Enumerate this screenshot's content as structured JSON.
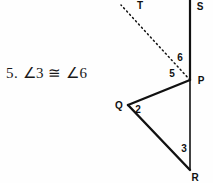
{
  "problem": {
    "number": "5.",
    "statement": "∠3 ≅ ∠6",
    "full_text": "5.  ∠3 ≅ ∠6"
  },
  "diagram": {
    "points": [
      {
        "label": "S",
        "x": 200,
        "y": 10
      },
      {
        "label": "T",
        "x": 140,
        "y": 9
      },
      {
        "label": "P",
        "x": 201,
        "y": 84
      },
      {
        "label": "Q",
        "x": 119,
        "y": 109
      },
      {
        "label": "R",
        "x": 195,
        "y": 181
      }
    ],
    "angle_labels": [
      {
        "label": "6",
        "x": 180,
        "y": 61
      },
      {
        "label": "5",
        "x": 172,
        "y": 77
      },
      {
        "label": "2",
        "x": 138,
        "y": 113
      },
      {
        "label": "3",
        "x": 184,
        "y": 152
      }
    ],
    "solid_segments": [
      {
        "name": "segment-SP",
        "x1": 190,
        "y1": 0,
        "x2": 190,
        "y2": 80
      },
      {
        "name": "segment-PR",
        "x1": 190,
        "y1": 80,
        "x2": 190,
        "y2": 170
      },
      {
        "name": "segment-PQ",
        "x1": 190,
        "y1": 80,
        "x2": 128,
        "y2": 105
      },
      {
        "name": "segment-QR",
        "x1": 128,
        "y1": 105,
        "x2": 190,
        "y2": 170
      }
    ],
    "dotted_segments": [
      {
        "name": "ray-PT",
        "x1": 190,
        "y1": 80,
        "x2": 121,
        "y2": 5
      }
    ],
    "colors": {
      "line": "#111111",
      "background": "#fefefe",
      "text": "#1a1a1a"
    }
  }
}
